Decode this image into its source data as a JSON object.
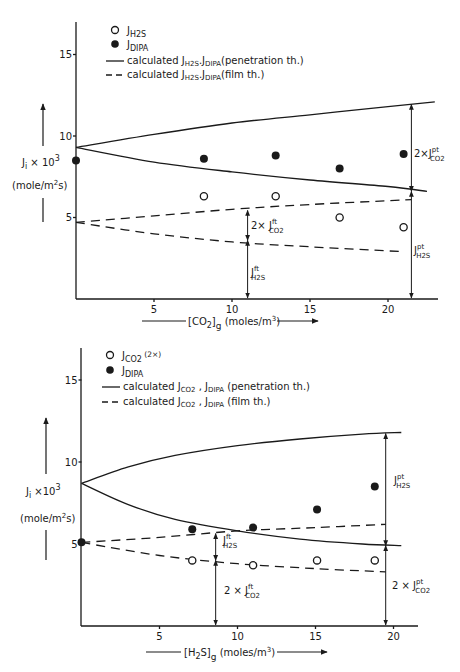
{
  "chart_data": [
    {
      "type": "scatter",
      "title": "",
      "xlabel": "[CO2]g (moles/m3)",
      "ylabel": "Ji x 10^3 (mole/m2s)",
      "xlim": [
        0,
        23
      ],
      "ylim": [
        0,
        17
      ],
      "xticks": [
        5,
        10,
        15,
        20
      ],
      "yticks": [
        5,
        10,
        15
      ],
      "grid": false,
      "legend_position": "upper-left",
      "legend": [
        {
          "marker": "open-circle",
          "label": "J_H2S"
        },
        {
          "marker": "filled-circle",
          "label": "J_DIPA"
        },
        {
          "line": "solid",
          "label": "calculated J_H2S, J_DIPA (penetration th.)"
        },
        {
          "line": "dashed",
          "label": "calculated J_H2S, J_DIPA (film th.)"
        }
      ],
      "series": [
        {
          "name": "J_H2S",
          "marker": "open",
          "x": [
            8.2,
            12.8,
            16.9,
            21.0
          ],
          "y": [
            6.3,
            6.3,
            5.0,
            4.4
          ]
        },
        {
          "name": "J_DIPA",
          "marker": "filled",
          "x": [
            0,
            8.2,
            12.8,
            16.9,
            21.0
          ],
          "y": [
            8.5,
            8.6,
            8.8,
            8.0,
            8.9
          ]
        },
        {
          "name": "penetration upper",
          "line": "solid",
          "x": [
            0,
            5,
            10,
            15,
            20,
            23
          ],
          "y": [
            9.3,
            10.1,
            10.8,
            11.3,
            11.8,
            12.1
          ]
        },
        {
          "name": "penetration lower",
          "line": "solid",
          "x": [
            0,
            5,
            10,
            15,
            20,
            22.5
          ],
          "y": [
            9.3,
            8.4,
            7.8,
            7.3,
            6.9,
            6.6
          ]
        },
        {
          "name": "film upper",
          "line": "dashed",
          "x": [
            0,
            5,
            10,
            15,
            21.5
          ],
          "y": [
            4.7,
            5.1,
            5.5,
            5.8,
            6.1
          ]
        },
        {
          "name": "film lower",
          "line": "dashed",
          "x": [
            0,
            5,
            10,
            15,
            21.0
          ],
          "y": [
            4.7,
            4.0,
            3.5,
            3.2,
            2.9
          ]
        }
      ],
      "annotations": [
        {
          "text": "2×J_CO2^pt",
          "x": 21.5,
          "y": 9.4
        },
        {
          "text": "J_H2S^pt",
          "x": 21.5,
          "y": 3.0
        },
        {
          "text": "2×J_CO2^ft",
          "x": 11,
          "y": 4.7
        },
        {
          "text": "J_H2S^ft",
          "x": 11,
          "y": 1.7
        }
      ],
      "arrows": [
        {
          "x": 11,
          "from": 0,
          "to": 5.5,
          "split": 3.6
        },
        {
          "x": 21.5,
          "from": 0,
          "to": 12.0,
          "split": 6.6
        }
      ]
    },
    {
      "type": "scatter",
      "title": "",
      "xlabel": "[H2S]g (moles/m3)",
      "ylabel": "Ji x 10^3 (mole/m2s)",
      "xlim": [
        0,
        21.5
      ],
      "ylim": [
        0,
        17
      ],
      "xticks": [
        5,
        10,
        15,
        20
      ],
      "yticks": [
        5,
        10,
        15
      ],
      "grid": false,
      "legend_position": "upper-left",
      "legend": [
        {
          "marker": "open-circle",
          "label": "J_CO2 (2×)"
        },
        {
          "marker": "filled-circle",
          "label": "J_DIPA"
        },
        {
          "line": "solid",
          "label": "calculated J_CO2, J_DIPA (penetration th.)"
        },
        {
          "line": "dashed",
          "label": "calculated J_CO2, J_DIPA (film th.)"
        }
      ],
      "series": [
        {
          "name": "J_CO2 (2x)",
          "marker": "open",
          "x": [
            7.1,
            11.0,
            15.1,
            18.8
          ],
          "y": [
            4.0,
            3.7,
            4.0,
            4.0
          ]
        },
        {
          "name": "J_DIPA",
          "marker": "filled",
          "x": [
            0,
            7.1,
            11.0,
            15.1,
            18.8
          ],
          "y": [
            5.1,
            5.9,
            6.0,
            7.1,
            8.5
          ]
        },
        {
          "name": "penetration upper",
          "line": "solid",
          "x": [
            0,
            3,
            6,
            10,
            14,
            18,
            20.5
          ],
          "y": [
            8.7,
            9.7,
            10.4,
            11.0,
            11.4,
            11.7,
            11.8
          ]
        },
        {
          "name": "penetration lower",
          "line": "solid",
          "x": [
            0,
            3,
            6,
            10,
            14,
            18,
            20.5
          ],
          "y": [
            8.7,
            7.4,
            6.5,
            5.8,
            5.3,
            5.0,
            4.9
          ]
        },
        {
          "name": "film upper",
          "line": "dashed",
          "x": [
            0,
            5,
            10,
            15,
            19.5
          ],
          "y": [
            5.1,
            5.4,
            5.8,
            6.0,
            6.2
          ]
        },
        {
          "name": "film lower",
          "line": "dashed",
          "x": [
            0,
            5,
            10,
            15,
            19.5
          ],
          "y": [
            5.1,
            4.3,
            3.8,
            3.5,
            3.3
          ]
        }
      ],
      "annotations": [
        {
          "text": "J_H2S^pt",
          "x": 19.5,
          "y": 8.6
        },
        {
          "text": "2×J_CO2^pt",
          "x": 19.5,
          "y": 2.5
        },
        {
          "text": "J_H2S^ft",
          "x": 8.6,
          "y": 4.8
        },
        {
          "text": "2×J_CO2^ft",
          "x": 8.6,
          "y": 1.9
        }
      ],
      "arrows": [
        {
          "x": 8.6,
          "from": 0,
          "to": 5.7,
          "split": 4.0
        },
        {
          "x": 19.5,
          "from": 0,
          "to": 11.8,
          "split": 4.9
        }
      ]
    }
  ],
  "panels": [
    {
      "legend": {
        "open": "J",
        "open_sub": "H2S",
        "filled": "J",
        "filled_sub": "DIPA",
        "solid_text": "calculated  J",
        "solid_sub1": "H2S",
        "solid_mid": ".J",
        "solid_sub2": "DIPA",
        "solid_tail": "(penetration th.)",
        "dash_text": "calculated  J",
        "dash_sub1": "H2S",
        "dash_mid": ".J",
        "dash_sub2": "DIPA",
        "dash_tail": "(film th.)"
      },
      "ylabel_main": "J",
      "ylabel_sub": "i",
      "ylabel_mult": " × 10",
      "ylabel_exp": "3",
      "ylabel_units": "(mole/m",
      "ylabel_units_exp": "2",
      "ylabel_units_tail": "s)",
      "xlabel_pre": "[CO",
      "xlabel_sub": "2",
      "xlabel_post": "]",
      "xlabel_sub2": "g",
      "xlabel_units": " (moles/m",
      "xlabel_exp": "3",
      "xlabel_tail": ")",
      "tick_labels_x": [
        "5",
        "10",
        "15",
        "20"
      ],
      "tick_labels_y": [
        "5",
        "10",
        "15"
      ],
      "ann": {
        "a1_pre": "2×J",
        "a1_sup": "pt",
        "a1_sub": "CO2",
        "a2_pre": "J",
        "a2_sup": "pt",
        "a2_sub": "H2S",
        "a3_pre": "2× J",
        "a3_sup": "ft",
        "a3_sub": "CO2",
        "a4_pre": "J",
        "a4_sup": "ft",
        "a4_sub": "H2S"
      }
    },
    {
      "legend": {
        "open": "J",
        "open_sub": "CO2",
        "open_tail": " (2×)",
        "filled": "J",
        "filled_sub": "DIPA",
        "solid_text": "calculated  J",
        "solid_sub1": "CO2",
        "solid_mid": " , J",
        "solid_sub2": "DIPA",
        "solid_tail": " (penetration th.)",
        "dash_text": "calculated  J",
        "dash_sub1": "CO2",
        "dash_mid": " , J",
        "dash_sub2": "DIPA",
        "dash_tail": " (film th.)"
      },
      "ylabel_main": "J",
      "ylabel_sub": "i",
      "ylabel_mult": " ×10",
      "ylabel_exp": "3",
      "ylabel_units": "(mole/m",
      "ylabel_units_exp": "2",
      "ylabel_units_tail": "s)",
      "xlabel_pre": "[H",
      "xlabel_sub": "2",
      "xlabel_post": "S]",
      "xlabel_sub2": "g",
      "xlabel_units": " (moles/m",
      "xlabel_exp": "3",
      "xlabel_tail": ")",
      "tick_labels_x": [
        "5",
        "10",
        "15",
        "20"
      ],
      "tick_labels_y": [
        "5",
        "10",
        "15"
      ],
      "ann": {
        "a1_pre": "J",
        "a1_sup": "pt",
        "a1_sub": "H2S",
        "a2_pre": "2 × J",
        "a2_sup": "pt",
        "a2_sub": "CO2",
        "a3_pre": "J",
        "a3_sup": "ft",
        "a3_sub": "H2S",
        "a4_pre": "2 × J",
        "a4_sup": "ft",
        "a4_sub": "CO2"
      }
    }
  ]
}
